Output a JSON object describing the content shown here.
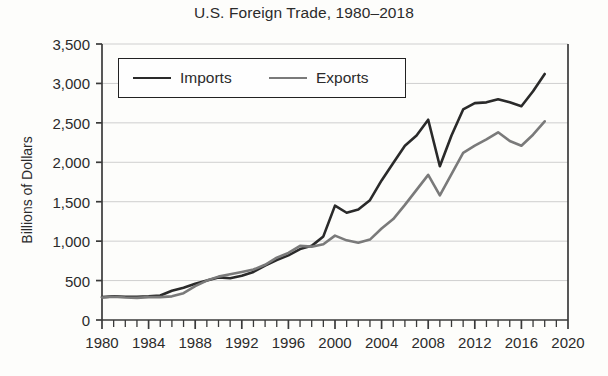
{
  "chart_data": {
    "type": "line",
    "title": "U.S. Foreign Trade, 1980–2018",
    "xlabel": "",
    "ylabel": "Billions of Dollars",
    "xlim": [
      1980,
      2020
    ],
    "ylim": [
      0,
      3500
    ],
    "grid": "horizontal",
    "legend_position": "upper-left-inside",
    "y_ticks": [
      0,
      500,
      1000,
      1500,
      2000,
      2500,
      3000,
      3500
    ],
    "y_tick_labels": [
      "0",
      "500",
      "1,000",
      "1,500",
      "2,000",
      "2,500",
      "3,000",
      "3,500"
    ],
    "x_ticks": [
      1980,
      1984,
      1988,
      1992,
      1996,
      2000,
      2004,
      2008,
      2012,
      2016,
      2020
    ],
    "x_tick_labels": [
      "1980",
      "1984",
      "1988",
      "1992",
      "1996",
      "2000",
      "2004",
      "2008",
      "2012",
      "2016",
      "2020"
    ],
    "x_minor_tick_step": 1,
    "x": [
      1980,
      1981,
      1982,
      1983,
      1984,
      1985,
      1986,
      1987,
      1988,
      1989,
      1990,
      1991,
      1992,
      1993,
      1994,
      1995,
      1996,
      1997,
      1998,
      1999,
      2000,
      2001,
      2002,
      2003,
      2004,
      2005,
      2006,
      2007,
      2008,
      2009,
      2010,
      2011,
      2012,
      2013,
      2014,
      2015,
      2016,
      2017,
      2018
    ],
    "series": [
      {
        "name": "Imports",
        "color": "#2a2a2a",
        "values": [
          290,
          300,
          295,
          295,
          300,
          310,
          370,
          410,
          460,
          500,
          540,
          530,
          560,
          610,
          690,
          760,
          820,
          900,
          940,
          1060,
          1450,
          1360,
          1400,
          1520,
          1770,
          1990,
          2210,
          2340,
          2540,
          1950,
          2340,
          2670,
          2750,
          2760,
          2800,
          2760,
          2710,
          2900,
          3120
        ]
      },
      {
        "name": "Exports",
        "color": "#7a7a7a",
        "values": [
          285,
          295,
          285,
          280,
          290,
          290,
          300,
          340,
          430,
          500,
          550,
          580,
          610,
          640,
          700,
          790,
          850,
          940,
          930,
          960,
          1070,
          1010,
          980,
          1020,
          1160,
          1280,
          1460,
          1650,
          1840,
          1580,
          1850,
          2120,
          2210,
          2290,
          2380,
          2270,
          2210,
          2350,
          2520
        ]
      }
    ]
  },
  "legend": {
    "entries": [
      {
        "label": "Imports"
      },
      {
        "label": "Exports"
      }
    ]
  },
  "axes": {
    "y_title": "Billions of Dollars"
  }
}
